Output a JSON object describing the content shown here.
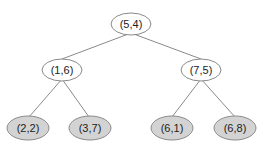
{
  "diagram": {
    "type": "binary-tree",
    "colors": {
      "edge": "#8a8a8a",
      "internal_fill": "#ffffff",
      "leaf_fill": "#d3d3d3",
      "text": "#222222"
    },
    "nodes": [
      {
        "id": "n0",
        "label": "(5,4)",
        "kind": "internal",
        "cx": 131,
        "cy": 24,
        "rx": 20,
        "ry": 11
      },
      {
        "id": "n1",
        "label": "(1,6)",
        "kind": "internal",
        "cx": 62,
        "cy": 70,
        "rx": 20,
        "ry": 11
      },
      {
        "id": "n2",
        "label": "(7,5)",
        "kind": "internal",
        "cx": 201,
        "cy": 70,
        "rx": 20,
        "ry": 11
      },
      {
        "id": "n3",
        "label": "(2,2)",
        "kind": "leaf",
        "cx": 28,
        "cy": 128,
        "rx": 21,
        "ry": 12
      },
      {
        "id": "n4",
        "label": "(3,7)",
        "kind": "leaf",
        "cx": 90,
        "cy": 128,
        "rx": 21,
        "ry": 12
      },
      {
        "id": "n5",
        "label": "(6,1)",
        "kind": "leaf",
        "cx": 172,
        "cy": 128,
        "rx": 21,
        "ry": 12
      },
      {
        "id": "n6",
        "label": "(6,8)",
        "kind": "leaf",
        "cx": 235,
        "cy": 128,
        "rx": 21,
        "ry": 12
      }
    ],
    "edges": [
      {
        "from": "n0",
        "to": "n1",
        "x1": 131,
        "y1": 33,
        "x2": 62,
        "y2": 59
      },
      {
        "from": "n0",
        "to": "n2",
        "x1": 131,
        "y1": 33,
        "x2": 201,
        "y2": 59
      },
      {
        "from": "n1",
        "to": "n3",
        "x1": 62,
        "y1": 79,
        "x2": 29,
        "y2": 117
      },
      {
        "from": "n1",
        "to": "n4",
        "x1": 62,
        "y1": 79,
        "x2": 89,
        "y2": 117
      },
      {
        "from": "n2",
        "to": "n5",
        "x1": 201,
        "y1": 79,
        "x2": 172,
        "y2": 117
      },
      {
        "from": "n2",
        "to": "n6",
        "x1": 201,
        "y1": 79,
        "x2": 235,
        "y2": 117
      }
    ]
  }
}
